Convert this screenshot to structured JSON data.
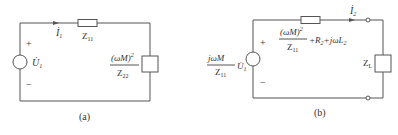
{
  "circuit_a": {
    "caption": "(a)",
    "current_label": "İ",
    "current_sub": "1",
    "series_impedance": "Z",
    "series_impedance_sub": "11",
    "source_label": "U̇",
    "source_sub": "1",
    "plus": "+",
    "minus": "−",
    "reflected_numerator": "(ωM)",
    "reflected_numerator_exp": "2",
    "reflected_denominator": "Z",
    "reflected_denominator_sub": "22"
  },
  "circuit_b": {
    "caption": "(b)",
    "current_label": "İ",
    "current_sub": "2",
    "source_coef_numerator": "jωM",
    "source_coef_denominator": "Z",
    "source_coef_denominator_sub": "11",
    "source_label": "U̇",
    "source_sub": "1",
    "plus": "+",
    "minus": "−",
    "series_numerator": "(ωM)",
    "series_numerator_exp": "2",
    "series_denominator": "Z",
    "series_denominator_sub": "11",
    "series_tail": "+R",
    "series_tail_sub": "2",
    "series_tail2": "+jωL",
    "series_tail2_sub": "2",
    "load_label": "Z",
    "load_sub": "L"
  },
  "colors": {
    "wire": "#555555",
    "text": "#333333"
  }
}
